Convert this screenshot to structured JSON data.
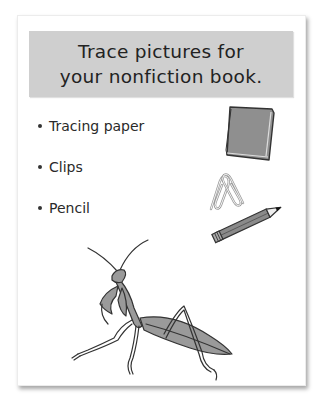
{
  "card": {
    "title_lines": [
      "Trace pictures for",
      "your nonfiction book."
    ],
    "materials": [
      {
        "label": "Tracing paper",
        "icon": "tracing-paper-icon"
      },
      {
        "label": "Clips",
        "icon": "paper-clips-icon"
      },
      {
        "label": "Pencil",
        "icon": "pencil-icon"
      }
    ],
    "illustration": "praying-mantis"
  },
  "colors": {
    "banner": "#cfcfcf",
    "illustration_fill": "#9a9a9a",
    "outline": "#333333"
  }
}
